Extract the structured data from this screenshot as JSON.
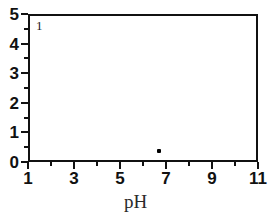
{
  "chart_data": {
    "type": "scatter",
    "title": "",
    "panel_label": "1",
    "xlabel": "pH",
    "ylabel": "",
    "xlim": [
      1,
      11
    ],
    "ylim": [
      0,
      5
    ],
    "grid": false,
    "legend": "none",
    "x_major_ticks": [
      1,
      3,
      5,
      7,
      9,
      11
    ],
    "x_minor_ticks": [
      2,
      4,
      6,
      8,
      10
    ],
    "x_ticklabels": [
      "1",
      "3",
      "5",
      "7",
      "9",
      "11"
    ],
    "y_major_ticks": [
      0,
      1,
      2,
      3,
      4,
      5
    ],
    "y_minor_ticks": [
      0.5,
      1.5,
      2.5,
      3.5,
      4.5
    ],
    "y_ticklabels": [
      "0",
      "1",
      "2",
      "3",
      "4",
      "5"
    ],
    "series": [
      {
        "name": "data",
        "marker": "square",
        "color": "#000000",
        "points": [
          {
            "x": 6.7,
            "y": 0.37
          }
        ]
      }
    ]
  },
  "style": {
    "ink_color": "#111111",
    "marker_color": "#000000",
    "background": "#ffffff"
  }
}
